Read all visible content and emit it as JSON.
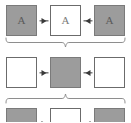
{
  "diagram": {
    "colors": {
      "filled": "#9c9c9c",
      "empty": "#ffffff",
      "border": "#6e6e6e",
      "arrow": "#3a3a3a",
      "brace": "#8a8a8a",
      "background": "#ffffff"
    },
    "rows": [
      {
        "id": "row-1",
        "cells": [
          {
            "state": "filled",
            "label": "A"
          },
          {
            "state": "empty",
            "label": "A"
          },
          {
            "state": "filled",
            "label": "A"
          }
        ],
        "arrows": [
          {
            "direction": "right",
            "glyph": "▶"
          },
          {
            "direction": "left",
            "glyph": "◀"
          }
        ]
      },
      {
        "id": "row-2",
        "cells": [
          {
            "state": "empty",
            "label": ""
          },
          {
            "state": "filled",
            "label": ""
          },
          {
            "state": "empty",
            "label": ""
          }
        ],
        "arrows": [
          {
            "direction": "right",
            "glyph": "▶"
          },
          {
            "direction": "left",
            "glyph": "◀"
          }
        ]
      },
      {
        "id": "row-3",
        "cells": [
          {
            "state": "filled",
            "label": ""
          },
          {
            "state": "empty",
            "label": ""
          },
          {
            "state": "filled",
            "label": ""
          }
        ],
        "arrows": [
          {
            "direction": "right",
            "glyph": "▶"
          },
          {
            "direction": "left",
            "glyph": "◀"
          }
        ]
      }
    ],
    "braces": [
      {
        "id": "brace-1",
        "orientation": "down",
        "spans": "row-1"
      },
      {
        "id": "brace-2",
        "orientation": "up",
        "spans": "row-3"
      }
    ]
  }
}
